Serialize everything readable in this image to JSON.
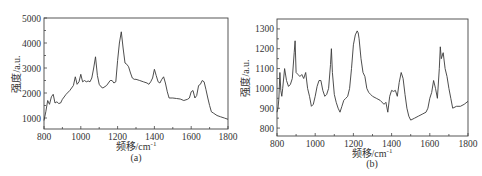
{
  "figure": {
    "panels": [
      {
        "id": "a",
        "caption": "(a)"
      },
      {
        "id": "b",
        "caption": "(b)"
      }
    ]
  },
  "chart_data": [
    {
      "type": "line",
      "title": "",
      "caption": "(a)",
      "xlabel": "频移/cm",
      "xlabel_sup": "-1",
      "ylabel": "强度/a.u.",
      "xlim": [
        800,
        1800
      ],
      "ylim": [
        560,
        5000
      ],
      "xticks": [
        800,
        1000,
        1200,
        1400,
        1600,
        1800
      ],
      "yticks": [
        1000,
        2000,
        3000,
        4000,
        5000
      ],
      "grid": false,
      "legend": null,
      "series": [
        {
          "name": "spectrum-a",
          "x": [
            800,
            810,
            820,
            830,
            840,
            850,
            860,
            870,
            880,
            890,
            900,
            920,
            940,
            960,
            970,
            980,
            990,
            1000,
            1010,
            1020,
            1030,
            1040,
            1050,
            1060,
            1070,
            1080,
            1090,
            1100,
            1110,
            1120,
            1140,
            1160,
            1170,
            1180,
            1190,
            1200,
            1210,
            1220,
            1230,
            1240,
            1250,
            1260,
            1270,
            1280,
            1290,
            1300,
            1320,
            1340,
            1360,
            1370,
            1380,
            1390,
            1400,
            1410,
            1420,
            1430,
            1440,
            1450,
            1460,
            1470,
            1480,
            1500,
            1520,
            1540,
            1560,
            1580,
            1590,
            1600,
            1610,
            1620,
            1630,
            1640,
            1650,
            1660,
            1670,
            1680,
            1690,
            1700,
            1710,
            1720,
            1740,
            1760,
            1780,
            1800
          ],
          "y": [
            900,
            1250,
            1700,
            1550,
            1850,
            1950,
            1600,
            1650,
            1580,
            1600,
            1750,
            1950,
            2100,
            2300,
            2650,
            2350,
            2450,
            2750,
            2450,
            2500,
            2450,
            2480,
            2450,
            2600,
            3000,
            3450,
            2700,
            2350,
            2250,
            2200,
            2300,
            2500,
            2500,
            2400,
            2450,
            3300,
            4000,
            4450,
            3800,
            3200,
            3150,
            3050,
            2800,
            2600,
            2550,
            2550,
            2500,
            2450,
            2400,
            2350,
            2450,
            2600,
            2950,
            2700,
            2450,
            2400,
            2550,
            2650,
            2400,
            2050,
            1800,
            1800,
            1780,
            1760,
            1700,
            1750,
            1800,
            2050,
            2100,
            1800,
            1900,
            2300,
            2350,
            2500,
            2450,
            2150,
            1800,
            1500,
            1250,
            1200,
            1100,
            1050,
            1000,
            950
          ]
        }
      ]
    },
    {
      "type": "line",
      "title": "",
      "caption": "(b)",
      "xlabel": "频移/cm",
      "xlabel_sup": "-1",
      "ylabel": "强度/a.u.",
      "xlim": [
        800,
        1800
      ],
      "ylim": [
        760,
        1350
      ],
      "xticks": [
        800,
        1000,
        1200,
        1400,
        1600,
        1800
      ],
      "yticks": [
        800,
        900,
        1000,
        1100,
        1200,
        1300
      ],
      "grid": false,
      "legend": null,
      "series": [
        {
          "name": "spectrum-b",
          "x": [
            800,
            805,
            810,
            815,
            820,
            825,
            830,
            840,
            850,
            860,
            870,
            880,
            890,
            895,
            900,
            910,
            920,
            930,
            940,
            950,
            960,
            970,
            980,
            990,
            1000,
            1010,
            1020,
            1030,
            1040,
            1050,
            1060,
            1070,
            1080,
            1085,
            1090,
            1100,
            1110,
            1120,
            1130,
            1140,
            1150,
            1160,
            1170,
            1180,
            1190,
            1200,
            1210,
            1220,
            1225,
            1230,
            1240,
            1250,
            1260,
            1270,
            1280,
            1290,
            1300,
            1320,
            1340,
            1360,
            1370,
            1380,
            1390,
            1400,
            1410,
            1420,
            1430,
            1440,
            1450,
            1460,
            1470,
            1480,
            1490,
            1500,
            1520,
            1540,
            1560,
            1580,
            1590,
            1600,
            1610,
            1620,
            1630,
            1640,
            1650,
            1655,
            1660,
            1670,
            1680,
            1690,
            1700,
            1710,
            1720,
            1740,
            1760,
            1780,
            1800
          ],
          "y": [
            880,
            900,
            950,
            1080,
            990,
            960,
            1000,
            1100,
            1040,
            1010,
            1020,
            1050,
            1180,
            1240,
            1080,
            1070,
            1060,
            1070,
            1050,
            1080,
            1000,
            960,
            910,
            920,
            960,
            1010,
            1040,
            1040,
            990,
            960,
            970,
            1000,
            1120,
            1200,
            1080,
            970,
            930,
            900,
            880,
            910,
            940,
            950,
            960,
            1000,
            1100,
            1220,
            1270,
            1290,
            1280,
            1250,
            1150,
            1080,
            1060,
            1000,
            980,
            970,
            960,
            950,
            940,
            920,
            930,
            880,
            960,
            990,
            985,
            990,
            960,
            1030,
            1080,
            1050,
            970,
            900,
            860,
            840,
            850,
            860,
            870,
            880,
            900,
            950,
            980,
            1040,
            1000,
            950,
            1100,
            1210,
            1150,
            1180,
            1100,
            1060,
            1000,
            950,
            900,
            910,
            910,
            920,
            935
          ]
        }
      ]
    }
  ]
}
